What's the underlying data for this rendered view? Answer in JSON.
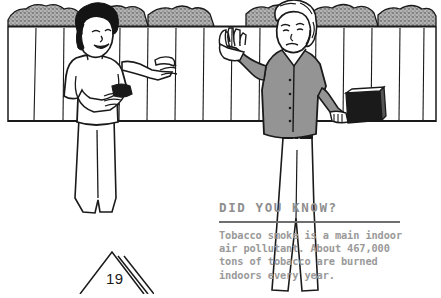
{
  "page": {
    "number": "19",
    "background_color": "#ffffff"
  },
  "illustration": {
    "name": "two-people-by-fence-line-drawing",
    "description": "Black and white line drawing of two people talking in front of a wooden fence with bushes behind it",
    "line_color": "#1a1a1a",
    "shirt_gray": "#949494",
    "bush_gray": "#a8a8a8",
    "briefcase_color": "#1a1a1a",
    "figures": [
      {
        "name": "person-smoker",
        "hair_color": "#141414",
        "shirt_color": "#ffffff",
        "holding": "cigarette-pack"
      },
      {
        "name": "person-refusing",
        "hair_color": "#ffffff",
        "shirt_color": "#949494",
        "holding": "briefcase",
        "gesture": "raised-hand-stop"
      }
    ]
  },
  "fact_box": {
    "title": "DID YOU KNOW?",
    "body": "Tobacco smoke is a main indoor air pollutant. About 467,000 tons of tobacco are burned indoors every year.",
    "title_color": "#8e8e8e",
    "body_color": "#9a9a9a",
    "rule_color": "#6f6f6f"
  }
}
